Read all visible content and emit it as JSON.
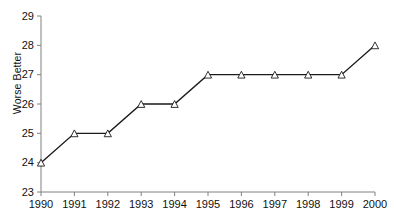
{
  "chart_data": {
    "type": "line",
    "title": "",
    "xlabel": "",
    "ylabel": "Worse Better",
    "categories": [
      "1990",
      "1991",
      "1992",
      "1993",
      "1994",
      "1995",
      "1996",
      "1997",
      "1998",
      "1999",
      "2000"
    ],
    "values": [
      24,
      25,
      25,
      26,
      26,
      27,
      27,
      27,
      27,
      27,
      28
    ],
    "series": [
      {
        "name": "series-1",
        "values": [
          24,
          25,
          25,
          26,
          26,
          27,
          27,
          27,
          27,
          27,
          28
        ],
        "marker": "open-triangle",
        "line_color": "#1a1a1a",
        "marker_fill": "#ffffff"
      }
    ],
    "ylim": [
      23,
      29
    ],
    "yticks": [
      23,
      24,
      25,
      26,
      27,
      28,
      29
    ],
    "ytick_labels": [
      "23",
      "24",
      "25",
      "26",
      "27",
      "28",
      "29"
    ],
    "xticks": [
      "1990",
      "1991",
      "1992",
      "1993",
      "1994",
      "1995",
      "1996",
      "1997",
      "1998",
      "1999",
      "2000"
    ],
    "grid": false,
    "legend": null,
    "legend_position": "none",
    "axis_color": "#808080",
    "background": "#ffffff"
  }
}
